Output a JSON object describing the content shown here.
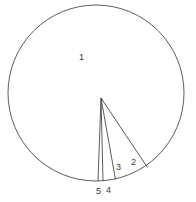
{
  "figure": {
    "type": "geometric-diagram",
    "background_color": "#ffffff",
    "stroke_color": "#4a4a4a",
    "label_color": "#3a3a3a",
    "canvas": {
      "width": 196,
      "height": 202
    }
  },
  "circle": {
    "center_x": 96,
    "center_y": 93,
    "radius": 88,
    "stroke_width": 0.9
  },
  "apex": {
    "name": "apex-point",
    "x": 101,
    "y": 98
  },
  "chords": [
    {
      "name": "chord-a",
      "x1": 101,
      "y1": 98,
      "x2": 98.0,
      "y2": 180.9
    },
    {
      "name": "chord-b",
      "x1": 101,
      "y1": 98,
      "x2": 103.0,
      "y2": 180.9
    },
    {
      "name": "chord-c",
      "x1": 101,
      "y1": 98,
      "x2": 115.5,
      "y2": 179.6
    },
    {
      "name": "chord-d",
      "x1": 101,
      "y1": 98,
      "x2": 147.5,
      "y2": 167.5
    }
  ],
  "labels": [
    {
      "name": "region-label-1",
      "text": "1",
      "x": 79,
      "y": 53
    },
    {
      "name": "region-label-2",
      "text": "2",
      "x": 131,
      "y": 158
    },
    {
      "name": "region-label-3",
      "text": "3",
      "x": 116,
      "y": 163
    },
    {
      "name": "region-label-4",
      "text": "4",
      "x": 106,
      "y": 186
    },
    {
      "name": "region-label-5",
      "text": "5",
      "x": 96,
      "y": 187
    }
  ]
}
